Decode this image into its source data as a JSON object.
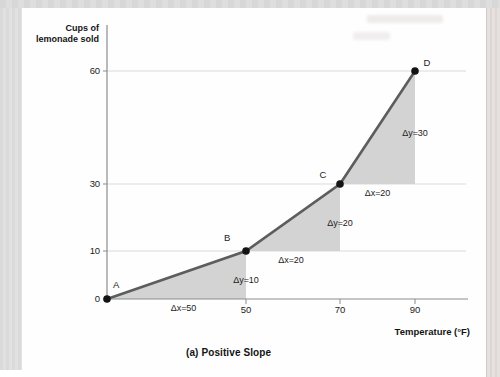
{
  "figure": {
    "caption": "(a) Positive Slope"
  },
  "chart_data": {
    "type": "line",
    "title": "",
    "xlabel": "Temperature (°F)",
    "ylabel": "Cups of lemonade sold",
    "ylabel_lines": [
      "Cups of",
      "lemonade sold"
    ],
    "x_ticks": [
      50,
      70,
      90
    ],
    "y_ticks": [
      0,
      10,
      30,
      60
    ],
    "xlim": [
      0,
      105
    ],
    "ylim": [
      0,
      75
    ],
    "grid": "horizontal",
    "legend": "none",
    "points": [
      {
        "label": "A",
        "x": 0,
        "y": 0
      },
      {
        "label": "B",
        "x": 50,
        "y": 10
      },
      {
        "label": "C",
        "x": 70,
        "y": 30
      },
      {
        "label": "D",
        "x": 90,
        "y": 60
      }
    ],
    "slope_triangles": [
      {
        "from": "A",
        "to": "B",
        "dx_label": "Δx=50",
        "dy_label": "Δy=10"
      },
      {
        "from": "B",
        "to": "C",
        "dx_label": "Δx=20",
        "dy_label": "Δy=20"
      },
      {
        "from": "C",
        "to": "D",
        "dx_label": "Δx=20",
        "dy_label": "Δy=30"
      }
    ],
    "colors": {
      "line": "#5c5d5f",
      "point": "#141414",
      "triangle_fill": "#d3d3d3",
      "gridline": "#dadada",
      "axis": "#8a8b8d",
      "text": "#1c1c1c"
    }
  }
}
